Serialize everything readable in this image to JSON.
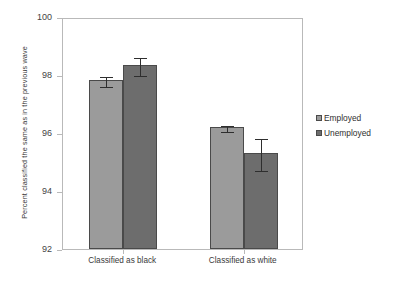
{
  "chart_data": {
    "type": "bar",
    "title": "",
    "subtitle": "",
    "xlabel": "",
    "ylabel": "Percent classified the same as in the previous wave",
    "categories": [
      "Classified as black",
      "Classified as white"
    ],
    "ylim": [
      92,
      100
    ],
    "yticks": [
      92,
      94,
      96,
      98,
      100
    ],
    "ytick_labels": [
      "92",
      "94",
      "96",
      "98",
      "100"
    ],
    "grid": false,
    "legend_position": "right",
    "series": [
      {
        "name": "Employed",
        "color": "#9b9b9b",
        "values": [
          97.83,
          96.2
        ],
        "errors": [
          0.16,
          0.1
        ]
      },
      {
        "name": "Unemployed",
        "color": "#6d6d6d",
        "values": [
          98.34,
          95.3
        ],
        "errors": [
          0.3,
          0.55
        ]
      }
    ],
    "legend": [
      {
        "label": "Employed",
        "swatch": "light"
      },
      {
        "label": "Unemployed",
        "swatch": "dark"
      }
    ],
    "axis_color": "#b9b9b9",
    "bar_edge_color": "#4a4a4a",
    "error_bar_color": "#2e2e2e"
  }
}
